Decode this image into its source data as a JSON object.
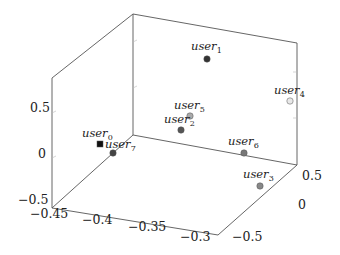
{
  "chart_data": {
    "type": "scatter3d",
    "title": "",
    "xlabel": "",
    "ylabel": "",
    "zlabel": "",
    "x_ticks": [
      "-0.45",
      "-0.4",
      "-0.35",
      "-0.3"
    ],
    "y_ticks": [
      "-0.5",
      "0",
      "0.5"
    ],
    "z_ticks": [
      "-0.5",
      "0",
      "0.5"
    ],
    "xlim": [
      -0.45,
      -0.28
    ],
    "ylim": [
      -0.7,
      0.7
    ],
    "zlim": [
      -0.5,
      0.95
    ],
    "grid": false,
    "legend": null,
    "points": [
      {
        "name": "user0",
        "label_base": "user",
        "label_sub": "0",
        "x": -0.42,
        "y": 0.05,
        "z": 0.05,
        "marker": "square",
        "color": "#111111"
      },
      {
        "name": "user1",
        "label_base": "user",
        "label_sub": "1",
        "x": -0.33,
        "y": 0.3,
        "z": 0.85,
        "marker": "circle",
        "color": "#333333"
      },
      {
        "name": "user2",
        "label_base": "user",
        "label_sub": "2",
        "x": -0.36,
        "y": 0.0,
        "z": 0.25,
        "marker": "circle",
        "color": "#555555"
      },
      {
        "name": "user3",
        "label_base": "user",
        "label_sub": "3",
        "x": -0.3,
        "y": -0.2,
        "z": -0.05,
        "marker": "circle",
        "color": "#888888"
      },
      {
        "name": "user4",
        "label_base": "user",
        "label_sub": "4",
        "x": -0.29,
        "y": 0.45,
        "z": 0.55,
        "marker": "circle",
        "color": "#dddddd"
      },
      {
        "name": "user5",
        "label_base": "user",
        "label_sub": "5",
        "x": -0.35,
        "y": 0.1,
        "z": 0.35,
        "marker": "circle",
        "color": "#aaaaaa"
      },
      {
        "name": "user6",
        "label_base": "user",
        "label_sub": "6",
        "x": -0.3,
        "y": 0.2,
        "z": 0.0,
        "marker": "circle",
        "color": "#777777"
      },
      {
        "name": "user7",
        "label_base": "user",
        "label_sub": "7",
        "x": -0.41,
        "y": 0.0,
        "z": -0.02,
        "marker": "circle",
        "color": "#444444"
      }
    ]
  },
  "axes": {
    "z_tick_labels": [
      {
        "text": "0.5",
        "px": 30,
        "py": 112
      },
      {
        "text": "0",
        "px": 38,
        "py": 158
      },
      {
        "text": "-0.5",
        "px": 18,
        "py": 204
      }
    ],
    "x_tick_labels": [
      {
        "text": "-0.45",
        "px": 30,
        "py": 218
      },
      {
        "text": "-0.4",
        "px": 82,
        "py": 224
      },
      {
        "text": "-0.35",
        "px": 128,
        "py": 231
      },
      {
        "text": "-0.3",
        "px": 180,
        "py": 241
      }
    ],
    "y_tick_labels": [
      {
        "text": "0.5",
        "px": 302,
        "py": 180
      },
      {
        "text": "0",
        "px": 298,
        "py": 209
      },
      {
        "text": "-0.5",
        "px": 232,
        "py": 241
      }
    ]
  },
  "markers": [
    {
      "id": "user0",
      "sub": "0",
      "shape": "square",
      "cx": 100,
      "cy": 144,
      "fill": "#111111",
      "lx": 82,
      "ly": 137
    },
    {
      "id": "user7",
      "sub": "7",
      "shape": "circle",
      "cx": 113,
      "cy": 153,
      "fill": "#444444",
      "lx": 105,
      "ly": 148
    },
    {
      "id": "user1",
      "sub": "1",
      "shape": "circle",
      "cx": 207,
      "cy": 59,
      "fill": "#333333",
      "lx": 191,
      "ly": 50
    },
    {
      "id": "user5",
      "sub": "5",
      "shape": "circle",
      "cx": 190,
      "cy": 116,
      "fill": "#aaaaaa",
      "lx": 174,
      "ly": 109
    },
    {
      "id": "user2",
      "sub": "2",
      "shape": "circle",
      "cx": 181,
      "cy": 130,
      "fill": "#555555",
      "lx": 164,
      "ly": 123
    },
    {
      "id": "user4",
      "sub": "4",
      "shape": "circle",
      "cx": 290,
      "cy": 101,
      "fill": "#e8e8e8",
      "lx": 274,
      "ly": 94
    },
    {
      "id": "user6",
      "sub": "6",
      "shape": "circle",
      "cx": 244,
      "cy": 153,
      "fill": "#777777",
      "lx": 228,
      "ly": 145
    },
    {
      "id": "user3",
      "sub": "3",
      "shape": "circle",
      "cx": 260,
      "cy": 186,
      "fill": "#888888",
      "lx": 243,
      "ly": 178
    }
  ]
}
